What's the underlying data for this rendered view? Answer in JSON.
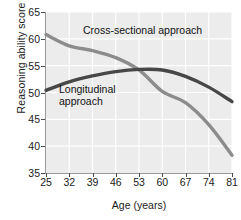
{
  "chart_data": {
    "type": "line",
    "title": "",
    "xlabel": "Age (years)",
    "ylabel": "Reasoning ability score",
    "xlim": [
      25,
      81
    ],
    "ylim": [
      35,
      65
    ],
    "xticks": [
      25,
      32,
      39,
      46,
      53,
      60,
      67,
      74,
      81
    ],
    "yticks": [
      35,
      40,
      45,
      50,
      55,
      60,
      65
    ],
    "grid": true,
    "legend_position": "inline-annotations",
    "series": [
      {
        "name": "Cross-sectional approach",
        "color": "#8c8c8c",
        "x": [
          25,
          32,
          39,
          46,
          53,
          60,
          67,
          74,
          81
        ],
        "values": [
          60.8,
          58.7,
          57.8,
          56.5,
          54.2,
          50.2,
          48.1,
          44.0,
          38.3
        ]
      },
      {
        "name": "Longitudinal approach",
        "color": "#474747",
        "x": [
          25,
          32,
          39,
          46,
          53,
          60,
          67,
          74,
          81
        ],
        "values": [
          50.4,
          52.0,
          53.1,
          53.9,
          54.3,
          54.2,
          53.0,
          51.0,
          48.3
        ]
      }
    ],
    "annotations": [
      {
        "name": "cross-sectional-label",
        "text": "Cross-sectional approach"
      },
      {
        "name": "longitudinal-label-line1",
        "text": "Longitudinal"
      },
      {
        "name": "longitudinal-label-line2",
        "text": "approach"
      }
    ],
    "colors": {
      "plot_background": "#ececec",
      "gridline": "#ffffff",
      "axis": "#9a9a9a",
      "text": "#1a1a1a"
    }
  }
}
